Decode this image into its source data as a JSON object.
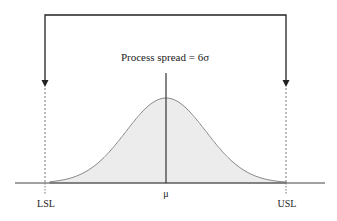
{
  "diagram": {
    "title_label": "Process spread = 6σ",
    "mean_label": "μ",
    "lsl_label": "LSL",
    "usl_label": "USL",
    "type": "normal-distribution-spec-limits",
    "geometry": {
      "mu_x": 166,
      "sigma_px": 40,
      "baseline_y": 183,
      "peak_y": 98,
      "lsl_x": 46,
      "usl_x": 287,
      "bracket_top_y": 15,
      "axis_start_x": 15,
      "axis_end_x": 325
    },
    "colors": {
      "line": "#222222",
      "curve_stroke": "#8a8a8a",
      "curve_fill": "#ececec",
      "dashed": "#777777"
    }
  }
}
